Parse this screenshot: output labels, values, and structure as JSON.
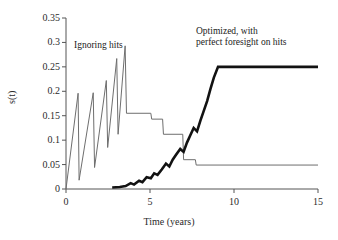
{
  "chart_data": {
    "type": "line",
    "title": "",
    "xlabel": "Time (years)",
    "ylabel": "s(t)",
    "xlim": [
      0,
      15
    ],
    "ylim": [
      0,
      0.35
    ],
    "xticks": [
      0,
      5,
      10,
      15
    ],
    "xtick_labels": [
      "0",
      "5",
      "10",
      "15"
    ],
    "yticks": [
      0,
      0.05,
      0.1,
      0.15,
      0.2,
      0.25,
      0.3,
      0.35
    ],
    "ytick_labels": [
      "0",
      "0.05",
      "0.1",
      "0.15",
      "0.2",
      "0.25",
      "0.3",
      "0.35"
    ],
    "grid": false,
    "legend": "annotations",
    "annotations": [
      {
        "name": "ignoring-hits",
        "text": "Ignoring hits",
        "x": 1.2,
        "y": 0.295,
        "color": "#1a1a1a"
      },
      {
        "name": "optimized-perfect-foresight",
        "text": "Optimized, with\nperfect foresight on hits",
        "x": 8.4,
        "y": 0.325,
        "color": "#1a1a1a"
      }
    ],
    "series": [
      {
        "name": "Ignoring hits",
        "style": "thin",
        "color": "#6e6e6e",
        "width": 1,
        "points": [
          [
            0.0,
            0.0
          ],
          [
            0.72,
            0.196
          ],
          [
            0.78,
            0.018
          ],
          [
            1.62,
            0.197
          ],
          [
            1.7,
            0.044
          ],
          [
            2.4,
            0.222
          ],
          [
            2.48,
            0.085
          ],
          [
            3.02,
            0.267
          ],
          [
            3.1,
            0.112
          ],
          [
            3.52,
            0.293
          ],
          [
            3.6,
            0.155
          ],
          [
            5.05,
            0.155
          ],
          [
            5.1,
            0.143
          ],
          [
            5.75,
            0.143
          ],
          [
            5.8,
            0.112
          ],
          [
            6.95,
            0.112
          ],
          [
            7.0,
            0.06
          ],
          [
            7.7,
            0.06
          ],
          [
            7.75,
            0.049
          ],
          [
            15.0,
            0.049
          ]
        ]
      },
      {
        "name": "Optimized, with perfect foresight on hits",
        "style": "thick",
        "color": "#121212",
        "width": 2.6,
        "points": [
          [
            2.75,
            0.003
          ],
          [
            3.2,
            0.004
          ],
          [
            3.55,
            0.006
          ],
          [
            3.85,
            0.012
          ],
          [
            4.05,
            0.009
          ],
          [
            4.35,
            0.017
          ],
          [
            4.55,
            0.014
          ],
          [
            4.8,
            0.024
          ],
          [
            5.05,
            0.022
          ],
          [
            5.25,
            0.032
          ],
          [
            5.45,
            0.029
          ],
          [
            5.7,
            0.04
          ],
          [
            5.95,
            0.052
          ],
          [
            6.15,
            0.046
          ],
          [
            6.35,
            0.06
          ],
          [
            6.55,
            0.07
          ],
          [
            6.8,
            0.082
          ],
          [
            7.0,
            0.076
          ],
          [
            7.2,
            0.095
          ],
          [
            7.4,
            0.11
          ],
          [
            7.6,
            0.125
          ],
          [
            7.8,
            0.118
          ],
          [
            8.0,
            0.14
          ],
          [
            8.2,
            0.16
          ],
          [
            8.4,
            0.18
          ],
          [
            8.6,
            0.205
          ],
          [
            8.8,
            0.228
          ],
          [
            9.05,
            0.25
          ],
          [
            15.0,
            0.25
          ]
        ]
      }
    ]
  }
}
